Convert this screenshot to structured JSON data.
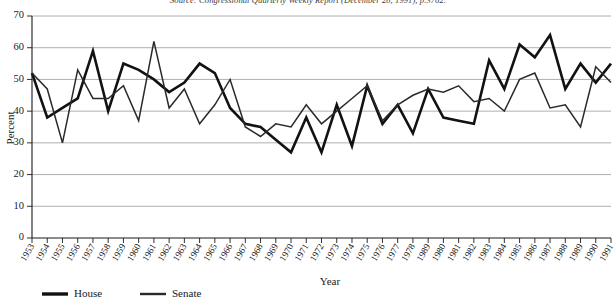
{
  "source_note": "Source: Congressional Quarterly Weekly Report (December 28, 1991), p.3762.",
  "legend": {
    "items": [
      {
        "name": "house",
        "label": "House"
      },
      {
        "name": "senate",
        "label": "Senate"
      }
    ]
  },
  "chart_data": {
    "type": "line",
    "title": "",
    "xlabel": "Year",
    "ylabel": "Percent",
    "xlim": [
      1953,
      1991
    ],
    "ylim": [
      0,
      70
    ],
    "ytick_step": 10,
    "yticks": [
      0,
      10,
      20,
      30,
      40,
      50,
      60,
      70
    ],
    "grid": true,
    "legend_position": "bottom-left",
    "categories": [
      "1953",
      "1954",
      "1955",
      "1956",
      "1957",
      "1958",
      "1959",
      "1960",
      "1961",
      "1962",
      "1963",
      "1964",
      "1965",
      "1966",
      "1967",
      "1968",
      "1969",
      "1970",
      "1971",
      "1972",
      "1973",
      "1974",
      "1975",
      "1976",
      "1977",
      "1978",
      "1989",
      "1980",
      "1981",
      "1982",
      "1983",
      "1984",
      "1985",
      "1986",
      "1987",
      "1988",
      "1989",
      "1990",
      "1991"
    ],
    "x": [
      1953,
      1954,
      1955,
      1956,
      1957,
      1958,
      1959,
      1960,
      1961,
      1962,
      1963,
      1964,
      1965,
      1966,
      1967,
      1968,
      1969,
      1970,
      1971,
      1972,
      1973,
      1974,
      1975,
      1976,
      1977,
      1978,
      1979,
      1980,
      1981,
      1982,
      1983,
      1984,
      1985,
      1986,
      1987,
      1988,
      1989,
      1990,
      1991
    ],
    "series": [
      {
        "name": "House",
        "values": [
          52,
          38,
          41,
          44,
          59,
          40,
          55,
          53,
          50,
          46,
          49,
          55,
          52,
          41,
          36,
          35,
          31,
          27,
          38,
          27,
          42,
          29,
          48,
          36,
          42,
          33,
          47,
          38,
          37,
          36,
          56,
          47,
          61,
          57,
          64,
          47,
          55,
          49,
          55
        ]
      },
      {
        "name": "Senate",
        "values": [
          52,
          47,
          30,
          53,
          44,
          44,
          48,
          37,
          62,
          41,
          47,
          36,
          42,
          50,
          35,
          32,
          36,
          35,
          42,
          36,
          40,
          44,
          48,
          37,
          42,
          45,
          47,
          46,
          48,
          43,
          44,
          40,
          50,
          52,
          41,
          42,
          35,
          54,
          49
        ]
      }
    ]
  }
}
